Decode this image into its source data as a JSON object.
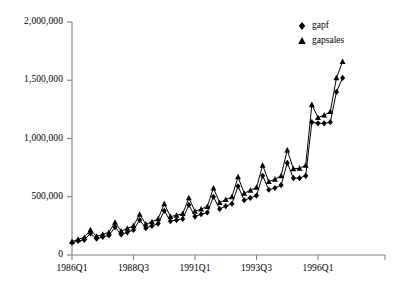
{
  "chart_data": {
    "type": "line",
    "title": "",
    "xlabel": "",
    "ylabel": "",
    "grid": false,
    "legend_position": "top-right",
    "ylim": [
      0,
      2000000
    ],
    "ytick_labels": [
      "0",
      "500,000",
      "1,000,000",
      "1,500,000",
      "2,000,000"
    ],
    "ytick_values": [
      0,
      500000,
      1000000,
      1500000,
      2000000
    ],
    "xtick_labels": [
      "1986Q1",
      "1988Q3",
      "1991Q1",
      "1993Q3",
      "1996Q1"
    ],
    "xtick_indices": [
      0,
      10,
      20,
      30,
      40
    ],
    "x_count": 45,
    "x": [
      "1986Q1",
      "1986Q2",
      "1986Q3",
      "1986Q4",
      "1987Q1",
      "1987Q2",
      "1987Q3",
      "1987Q4",
      "1988Q1",
      "1988Q2",
      "1988Q3",
      "1988Q4",
      "1989Q1",
      "1989Q2",
      "1989Q3",
      "1989Q4",
      "1990Q1",
      "1990Q2",
      "1990Q3",
      "1990Q4",
      "1991Q1",
      "1991Q2",
      "1991Q3",
      "1991Q4",
      "1992Q1",
      "1992Q2",
      "1992Q3",
      "1992Q4",
      "1993Q1",
      "1993Q2",
      "1993Q3",
      "1993Q4",
      "1994Q1",
      "1994Q2",
      "1994Q3",
      "1994Q4",
      "1995Q1",
      "1995Q2",
      "1995Q3",
      "1995Q4",
      "1996Q1",
      "1996Q2",
      "1996Q3",
      "1996Q4",
      "1997Q1"
    ],
    "series": [
      {
        "name": "gapf",
        "marker": "diamond",
        "color": "#000000",
        "values": [
          105000,
          120000,
          130000,
          185000,
          140000,
          155000,
          168000,
          240000,
          175000,
          195000,
          215000,
          300000,
          230000,
          250000,
          270000,
          380000,
          290000,
          300000,
          310000,
          430000,
          330000,
          350000,
          365000,
          500000,
          395000,
          420000,
          440000,
          590000,
          470000,
          490000,
          510000,
          680000,
          560000,
          575000,
          600000,
          790000,
          660000,
          660000,
          680000,
          1140000,
          1130000,
          1130000,
          1140000,
          1400000,
          1520000
        ]
      },
      {
        "name": "gapsales",
        "marker": "triangle",
        "color": "#000000",
        "values": [
          115000,
          135000,
          150000,
          215000,
          160000,
          178000,
          195000,
          280000,
          205000,
          228000,
          250000,
          350000,
          265000,
          285000,
          310000,
          440000,
          330000,
          340000,
          355000,
          490000,
          375000,
          395000,
          415000,
          575000,
          450000,
          475000,
          500000,
          670000,
          530000,
          555000,
          580000,
          770000,
          630000,
          650000,
          680000,
          900000,
          740000,
          745000,
          770000,
          1290000,
          1180000,
          1200000,
          1230000,
          1520000,
          1660000
        ]
      }
    ]
  },
  "legend": {
    "items": [
      {
        "label": "gapf",
        "marker": "diamond"
      },
      {
        "label": "gapsales",
        "marker": "triangle"
      }
    ]
  },
  "axes": {
    "y_axis_name": "y-axis",
    "x_axis_name": "x-axis"
  }
}
